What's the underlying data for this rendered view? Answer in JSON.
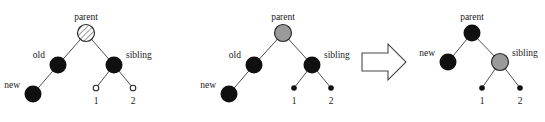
{
  "figure": {
    "background_color": "#ffffff",
    "width": 545,
    "height": 122
  },
  "colors": {
    "black_node": "#101010",
    "gray_node": "#9a9a9a",
    "hatched_node_fill": "#ffffff",
    "hatched_node_stroke": "#333333",
    "hollow_leaf_fill": "#ffffff",
    "edge": "#3a3a3a",
    "text": "#1a1a1a",
    "arrow_fill": "#ffffff",
    "arrow_stroke": "#4a4a4a"
  },
  "panels": [
    {
      "id": "tree-before-hatched",
      "nodes": [
        {
          "key": "parent",
          "label": "parent",
          "fill": "hatched",
          "radius": 8.5,
          "label_pos": "above"
        },
        {
          "key": "old",
          "label": "old",
          "fill": "black",
          "radius": 8.5,
          "label_pos": "left"
        },
        {
          "key": "sibling",
          "label": "sibling",
          "fill": "black",
          "radius": 8.5,
          "label_pos": "right"
        },
        {
          "key": "new",
          "label": "new",
          "fill": "black",
          "radius": 8.5,
          "label_pos": "left"
        },
        {
          "key": "leaf1",
          "label": "1",
          "fill": "hollow",
          "radius": 2.6,
          "label_pos": "below"
        },
        {
          "key": "leaf2",
          "label": "2",
          "fill": "hollow",
          "radius": 2.6,
          "label_pos": "below"
        }
      ],
      "edges": [
        {
          "from": "parent",
          "to": "old"
        },
        {
          "from": "parent",
          "to": "sibling"
        },
        {
          "from": "old",
          "to": "new"
        },
        {
          "from": "sibling",
          "to": "leaf1"
        },
        {
          "from": "sibling",
          "to": "leaf2"
        }
      ]
    },
    {
      "id": "tree-before-gray",
      "nodes": [
        {
          "key": "parent",
          "label": "parent",
          "fill": "gray",
          "radius": 8.5,
          "label_pos": "above"
        },
        {
          "key": "old",
          "label": "old",
          "fill": "black",
          "radius": 8.5,
          "label_pos": "left"
        },
        {
          "key": "sibling",
          "label": "sibling",
          "fill": "black",
          "radius": 8.5,
          "label_pos": "right"
        },
        {
          "key": "new",
          "label": "new",
          "fill": "black",
          "radius": 8.5,
          "label_pos": "left"
        },
        {
          "key": "leaf1",
          "label": "1",
          "fill": "black",
          "radius": 2.6,
          "label_pos": "below"
        },
        {
          "key": "leaf2",
          "label": "2",
          "fill": "black",
          "radius": 2.6,
          "label_pos": "below"
        }
      ],
      "edges": [
        {
          "from": "parent",
          "to": "old"
        },
        {
          "from": "parent",
          "to": "sibling"
        },
        {
          "from": "old",
          "to": "new"
        },
        {
          "from": "sibling",
          "to": "leaf1"
        },
        {
          "from": "sibling",
          "to": "leaf2"
        }
      ]
    },
    {
      "id": "tree-after",
      "nodes": [
        {
          "key": "parent",
          "label": "parent",
          "fill": "black",
          "radius": 8.5,
          "label_pos": "above"
        },
        {
          "key": "new",
          "label": "new",
          "fill": "black",
          "radius": 8.5,
          "label_pos": "left"
        },
        {
          "key": "sibling",
          "label": "sibling",
          "fill": "gray",
          "radius": 8.5,
          "label_pos": "right"
        },
        {
          "key": "leaf1",
          "label": "1",
          "fill": "black",
          "radius": 2.6,
          "label_pos": "below"
        },
        {
          "key": "leaf2",
          "label": "2",
          "fill": "black",
          "radius": 2.6,
          "label_pos": "below"
        }
      ],
      "edges": [
        {
          "from": "parent",
          "to": "new"
        },
        {
          "from": "parent",
          "to": "sibling"
        },
        {
          "from": "sibling",
          "to": "leaf1"
        },
        {
          "from": "sibling",
          "to": "leaf2"
        }
      ]
    }
  ],
  "arrow": {
    "name": "transformation-arrow",
    "direction": "right",
    "style": "hollow-block"
  },
  "labels": {
    "parent": "parent",
    "old": "old",
    "sibling": "sibling",
    "new": "new",
    "leaf_one": "1",
    "leaf_two": "2"
  }
}
